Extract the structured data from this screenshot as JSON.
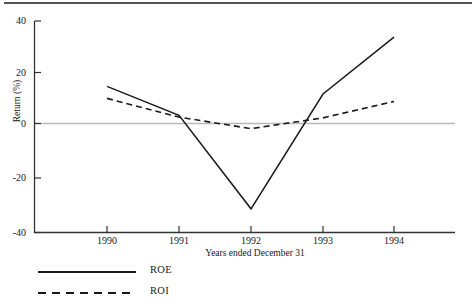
{
  "chart_data": {
    "type": "line",
    "title": "",
    "xlabel": "Years ended December 31",
    "ylabel": "Return (%)",
    "categories": [
      "1990",
      "1991",
      "1992",
      "1993",
      "1994"
    ],
    "x": [
      1990,
      1991,
      1992,
      1993,
      1994
    ],
    "series": [
      {
        "name": "ROE",
        "style": "solid",
        "color": "#1a1a1a",
        "values": [
          14.5,
          3.2,
          -33.3,
          11.5,
          33.7
        ]
      },
      {
        "name": "ROI",
        "style": "dashed",
        "color": "#1a1a1a",
        "values": [
          9.8,
          2.5,
          -2.0,
          2.2,
          8.6
        ]
      }
    ],
    "ylim": [
      -40,
      40
    ],
    "yticks": [
      40,
      20,
      0,
      -20,
      -40
    ],
    "ytick_labels": [
      "40",
      "20",
      "0",
      "-20",
      "-40"
    ],
    "xtick_labels": [
      "1990",
      "1991",
      "1992",
      "1993",
      "1994"
    ],
    "grid": false,
    "zero_line": true,
    "zero_line_color": "#b8b8b8",
    "legend_position": "below-left",
    "axis_color": "#333333"
  },
  "legend": {
    "items": [
      {
        "label": "ROE",
        "style": "solid"
      },
      {
        "label": "ROI",
        "style": "dashed"
      }
    ]
  }
}
